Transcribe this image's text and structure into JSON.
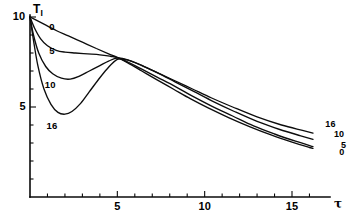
{
  "chart_data": {
    "type": "line",
    "title": "",
    "subtitle": "",
    "xlabel": "τ",
    "ylabel": "T",
    "ylabel_sub": "I",
    "xlim": [
      0,
      16.3
    ],
    "ylim": [
      0,
      11.3
    ],
    "grid": false,
    "legend_position": "inline-labels",
    "x_ticks_major": [
      5,
      10,
      15
    ],
    "x_tick_labels": [
      "5",
      "10",
      "15"
    ],
    "x_ticks_minor": [
      1,
      2,
      3,
      4,
      6,
      7,
      8,
      9,
      11,
      12,
      13,
      14,
      16
    ],
    "y_ticks_major": [
      5,
      10
    ],
    "y_tick_labels": [
      "5",
      "10"
    ],
    "y_ticks_minor": [
      1,
      2,
      3,
      4,
      6,
      7,
      8,
      9,
      11
    ],
    "series": [
      {
        "name": "0",
        "label_left": "0",
        "label_right": "0",
        "x": [
          0,
          0.3,
          0.8,
          1.5,
          2.2,
          3.0,
          3.8,
          4.5,
          5.0,
          5.6,
          6.4,
          7.2,
          8.2,
          9.2,
          10.2,
          11.4,
          12.6,
          13.8,
          15.0,
          16.0,
          16.2
        ],
        "y": [
          10.0,
          9.85,
          9.6,
          9.25,
          8.95,
          8.6,
          8.25,
          7.95,
          7.75,
          7.45,
          7.0,
          6.55,
          6.0,
          5.45,
          4.95,
          4.4,
          3.9,
          3.45,
          3.05,
          2.75,
          2.7
        ]
      },
      {
        "name": "5",
        "label_left": "5",
        "label_right": "5",
        "x": [
          0,
          0.25,
          0.6,
          1.0,
          1.5,
          2.0,
          2.6,
          3.3,
          4.0,
          4.6,
          5.0,
          5.6,
          6.4,
          7.3,
          8.3,
          9.3,
          10.4,
          11.6,
          12.8,
          14.0,
          15.2,
          16.2
        ],
        "y": [
          10.0,
          9.4,
          8.8,
          8.4,
          8.15,
          8.05,
          8.0,
          7.95,
          7.9,
          7.82,
          7.75,
          7.5,
          7.1,
          6.65,
          6.15,
          5.6,
          5.05,
          4.5,
          3.95,
          3.5,
          3.1,
          2.8
        ]
      },
      {
        "name": "10",
        "label_left": "10",
        "label_right": "10",
        "x": [
          0,
          0.2,
          0.5,
          0.9,
          1.3,
          1.8,
          2.3,
          2.8,
          3.4,
          4.0,
          4.5,
          5.0,
          5.6,
          6.4,
          7.3,
          8.3,
          9.4,
          10.5,
          11.7,
          13.0,
          14.3,
          15.5,
          16.2
        ],
        "y": [
          10.0,
          9.0,
          8.0,
          7.25,
          6.85,
          6.6,
          6.55,
          6.7,
          7.0,
          7.3,
          7.55,
          7.72,
          7.62,
          7.3,
          6.9,
          6.4,
          5.85,
          5.3,
          4.75,
          4.2,
          3.75,
          3.4,
          3.2
        ]
      },
      {
        "name": "16",
        "label_left": "16",
        "label_right": "16",
        "x": [
          0,
          0.2,
          0.45,
          0.8,
          1.2,
          1.6,
          2.0,
          2.4,
          2.9,
          3.4,
          3.9,
          4.4,
          5.0,
          5.6,
          6.3,
          7.2,
          8.2,
          9.3,
          10.4,
          11.6,
          13.0,
          14.4,
          15.6,
          16.2
        ],
        "y": [
          10.0,
          8.7,
          7.3,
          6.0,
          5.15,
          4.7,
          4.6,
          4.75,
          5.2,
          5.85,
          6.5,
          7.1,
          7.65,
          7.6,
          7.35,
          6.95,
          6.5,
          6.0,
          5.5,
          5.0,
          4.45,
          4.0,
          3.7,
          3.55
        ]
      }
    ],
    "curve_labels_left": [
      {
        "text": "0",
        "x": 1.1,
        "y": 9.45
      },
      {
        "text": "5",
        "x": 1.1,
        "y": 8.1
      },
      {
        "text": "10",
        "x": 0.85,
        "y": 6.2
      },
      {
        "text": "16",
        "x": 0.95,
        "y": 3.95
      }
    ],
    "curve_labels_right": [
      {
        "text": "16",
        "x": 16.9,
        "y": 4.0
      },
      {
        "text": "10",
        "x": 17.4,
        "y": 3.45
      },
      {
        "text": "5",
        "x": 17.8,
        "y": 2.85
      },
      {
        "text": "0",
        "x": 17.7,
        "y": 2.45
      }
    ]
  }
}
